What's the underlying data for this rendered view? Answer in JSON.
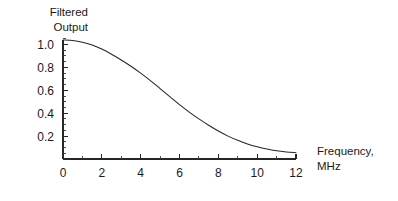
{
  "chart_data": {
    "type": "line",
    "title": "",
    "subtitle": "",
    "xlabel_line1": "Frequency,",
    "xlabel_line2": "MHz",
    "ylabel_line1": "Filtered",
    "ylabel_line2": "Output",
    "xlim": [
      0,
      12
    ],
    "ylim": [
      0,
      1.05
    ],
    "grid": false,
    "legend": null,
    "x_tick_labels": [
      "0",
      "2",
      "4",
      "6",
      "8",
      "10",
      "12"
    ],
    "x_tick_values": [
      0,
      2,
      4,
      6,
      8,
      10,
      12
    ],
    "x_minor_tick_values": [
      1,
      3,
      5,
      7,
      9,
      11
    ],
    "y_tick_labels": [
      "0.2",
      "0.4",
      "0.6",
      "0.8",
      "1.0"
    ],
    "y_tick_values": [
      0.2,
      0.4,
      0.6,
      0.8,
      1.0
    ],
    "y_minor_tick_values": [
      0.05,
      0.1,
      0.15,
      0.25,
      0.3,
      0.35,
      0.45,
      0.5,
      0.55,
      0.65,
      0.7,
      0.75,
      0.85,
      0.9,
      0.95,
      1.05
    ],
    "series": [
      {
        "name": "filtered-output",
        "color": "#262626",
        "x": [
          0,
          0.5,
          1,
          1.5,
          2,
          2.5,
          3,
          3.5,
          4,
          4.5,
          5,
          5.5,
          6,
          6.5,
          7,
          7.5,
          8,
          8.5,
          9,
          9.5,
          10,
          10.5,
          11,
          11.5,
          12
        ],
        "y": [
          1.04,
          1.035,
          1.02,
          0.995,
          0.96,
          0.915,
          0.865,
          0.81,
          0.75,
          0.685,
          0.615,
          0.545,
          0.475,
          0.41,
          0.35,
          0.295,
          0.245,
          0.2,
          0.163,
          0.132,
          0.107,
          0.087,
          0.072,
          0.062,
          0.055
        ]
      }
    ]
  },
  "layout": {
    "plot_left": 63,
    "plot_right": 296,
    "plot_bottom": 159,
    "plot_top": 40,
    "y_zero_px": 159,
    "y_unit_px": 114.5,
    "ylabel_x": 88,
    "ylabel_y1": 16,
    "ylabel_y2": 31,
    "xlabel_x": 317,
    "xlabel_y1": 155,
    "xlabel_y2": 170
  },
  "colors": {
    "background": "#ffffff",
    "axis": "#262626",
    "curve": "#262626",
    "text": "#1a1a1a"
  }
}
